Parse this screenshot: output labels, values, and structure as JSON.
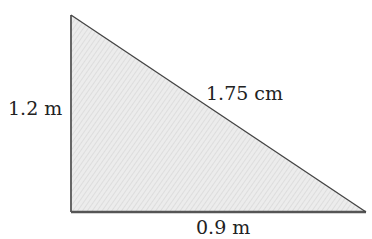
{
  "figure": {
    "type": "right-triangle",
    "fill_color": "#e6e6e6",
    "hatch_color": "#d2d2d2",
    "stroke_color": "#555555",
    "vertices": {
      "top": [
        71,
        15
      ],
      "bottom_left": [
        71,
        212
      ],
      "bottom_right": [
        366,
        212
      ]
    },
    "labels": {
      "vertical_side": "1.2 m",
      "hypotenuse": "1.75 cm",
      "base": "0.9 m"
    }
  }
}
